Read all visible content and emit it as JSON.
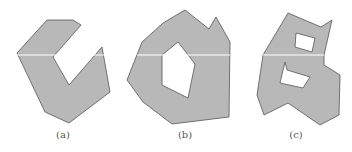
{
  "figure": {
    "fill_color": "#b8b8b8",
    "stroke_color": "#555555",
    "scanline_color": "#ffffff",
    "panels": [
      {
        "label": "(a)",
        "outer": "47,20 73,20 81,25 53,57 69,85 102,47 110,92 69,123 45,112 17,53",
        "holes": [],
        "scanline": {
          "x1": 17,
          "x2": 104,
          "y": 55
        }
      },
      {
        "label": "(b)",
        "outer": "185,10 209,29 216,17 230,42 229,117 172,124 143,102 127,80 142,42 163,23",
        "holes": [
          "178,42 195,64 188,98 162,85 162,55"
        ],
        "scanline": {
          "x1": 137,
          "x2": 230,
          "y": 55
        }
      },
      {
        "label": "(c)",
        "outer": "288,13 321,27 332,20 324,55 324,65 340,75 339,115 320,125 288,103 264,115 257,95 263,55",
        "holes": [
          "296,33 315,38 312,52 295,47",
          "285,62 287,70 310,77 303,88 280,83"
        ],
        "scanline": {
          "x1": 263,
          "x2": 324,
          "y": 55
        }
      }
    ]
  }
}
